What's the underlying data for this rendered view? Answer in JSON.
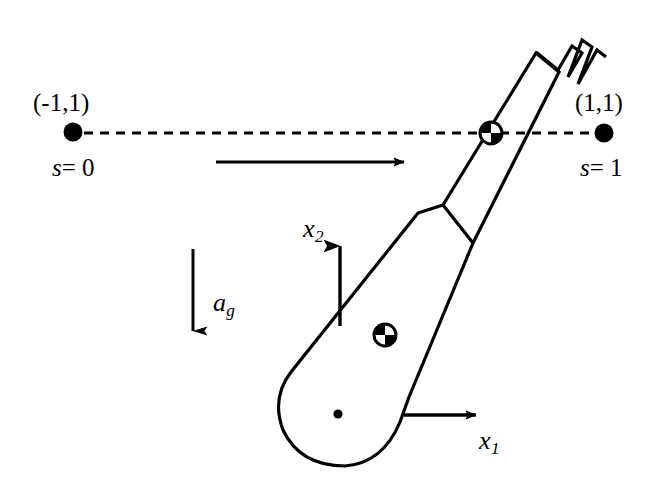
{
  "figure": {
    "background_color": "#ffffff",
    "stroke_color": "#000000",
    "width": 659,
    "height": 491
  },
  "labels": {
    "start_coord": "(-1,1)",
    "start_param": "s = 0",
    "start_param_symbol": "s",
    "start_param_value": "= 0",
    "end_coord": "(1,1)",
    "end_param": "s = 1",
    "end_param_symbol": "s",
    "end_param_value": "= 1",
    "axis_x1_symbol": "x",
    "axis_x1_sub": "1",
    "axis_x2_symbol": "x",
    "axis_x2_sub": "2",
    "gravity_symbol": "a",
    "gravity_sub": "g"
  },
  "markers": {
    "start_point": {
      "name": "start-waypoint-dot",
      "cx": 73,
      "cy": 132,
      "r": 9.5
    },
    "end_point": {
      "name": "end-waypoint-dot",
      "cx": 604,
      "cy": 133,
      "r": 9.5
    },
    "body_pivot_dot": {
      "name": "paddle-pivot-dot",
      "cx": 338,
      "cy": 414,
      "r": 4.5
    },
    "com_handle": {
      "name": "center-of-mass-handle",
      "cx": 491,
      "cy": 133,
      "r": 11
    },
    "com_body": {
      "name": "center-of-mass-body",
      "cx": 385,
      "cy": 335,
      "r": 11
    }
  },
  "arrows": {
    "velocity": {
      "name": "velocity-arrow",
      "x1": 216,
      "y1": 162,
      "x2": 414,
      "y2": 162,
      "direction": "right"
    },
    "gravity": {
      "name": "gravity-arrow",
      "x1": 193,
      "y1": 249,
      "x2": 193,
      "y2": 336,
      "direction": "down"
    },
    "axis_x2": {
      "name": "axis-x2-arrow",
      "x1": 340,
      "y1": 326,
      "x2": 340,
      "y2": 236,
      "direction": "up"
    },
    "axis_x1": {
      "name": "axis-x1-arrow",
      "x1": 404,
      "y1": 415,
      "x2": 486,
      "y2": 415,
      "direction": "right"
    }
  },
  "paths": {
    "trajectory_dashline": {
      "name": "trajectory-dashed-line",
      "x1": 84,
      "y1": 133,
      "x2": 594,
      "y2": 133,
      "dash": "9 7"
    },
    "paddle_body": "M 418,213 L 443,205 L 473,243 L 409,397 L 400,422 Q 383,463 345,466 Q 300,466 283,430 Q 271,398 291,372 L 418,213 Z",
    "shaft_left": "M 443,205 L 537,55",
    "shaft_right": "M 473,243 L 556,73",
    "shaft_cap": "M 537,55 L 556,73",
    "fork": "M 536,52 L 559,71 L 573,48 L 581,54 L 568,77 L 584,41 L 591,46 L 575,82 L 597,49 L 604,55"
  }
}
